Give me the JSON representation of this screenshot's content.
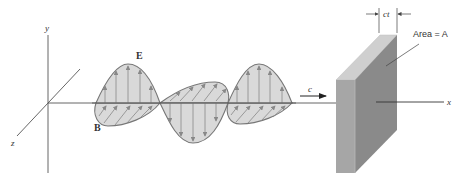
{
  "figure": {
    "axes": {
      "x_label": "x",
      "y_label": "y",
      "z_label": "z"
    },
    "fields": {
      "E_label": "E",
      "B_label": "B"
    },
    "propagation": {
      "speed_label": "c"
    },
    "slab": {
      "thickness_label": "ct",
      "area_label": "Area = A"
    },
    "colors": {
      "line": "#555555",
      "wave_fill": "#d9d9d9",
      "wave_stroke": "#777777",
      "slab_front": "#8a8a8a",
      "slab_side": "#a6a6a6",
      "slab_top": "#cfcfcf",
      "background": "#ffffff"
    }
  }
}
